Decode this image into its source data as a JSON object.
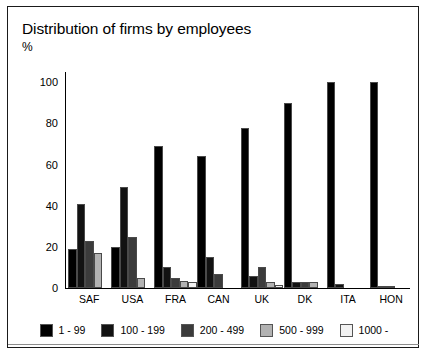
{
  "chart_data": {
    "type": "bar",
    "title": "Distribution of firms by employees",
    "unit_label": "%",
    "xlabel": "",
    "ylabel": "%",
    "ylim": [
      0,
      105
    ],
    "yticks": [
      0,
      20,
      40,
      60,
      80,
      100
    ],
    "grid": false,
    "legend_position": "bottom",
    "categories": [
      "SAF",
      "USA",
      "FRA",
      "CAN",
      "UK",
      "DK",
      "ITA",
      "HON"
    ],
    "series": [
      {
        "name": "1 - 99",
        "color": "#000000",
        "values": [
          19,
          20,
          69,
          64,
          78,
          90,
          100,
          100
        ]
      },
      {
        "name": "100 - 199",
        "color": "#121212",
        "values": [
          41,
          49,
          10,
          15,
          6,
          3,
          2,
          1
        ]
      },
      {
        "name": "200 - 499",
        "color": "#3b3b3b",
        "values": [
          23,
          25,
          5,
          7,
          10,
          3,
          0,
          0
        ]
      },
      {
        "name": "500 - 999",
        "color": "#b2b2b2",
        "values": [
          17,
          5,
          3.5,
          0,
          3,
          3,
          0,
          1
        ]
      },
      {
        "name": "1000 -",
        "color": "#f2f2f2",
        "values": [
          0,
          0,
          3,
          0,
          1.5,
          0,
          0,
          0
        ]
      }
    ]
  },
  "legend": {
    "items": [
      {
        "label": "1 - 99",
        "color": "#000000"
      },
      {
        "label": "100 - 199",
        "color": "#121212"
      },
      {
        "label": "200 - 499",
        "color": "#3b3b3b"
      },
      {
        "label": "500 - 999",
        "color": "#b2b2b2"
      },
      {
        "label": "1000 -",
        "color": "#f2f2f2"
      }
    ]
  }
}
